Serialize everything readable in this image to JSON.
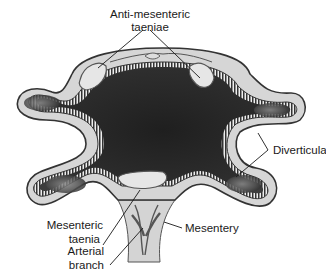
{
  "figure": {
    "colors": {
      "lumen_dark": "#2b2b2b",
      "lumen_mid": "#6a6a6a",
      "wall_outline": "#3a3a3a",
      "serosa_fill": "#d9d9d9",
      "background": "#ffffff",
      "text": "#1a1a1a"
    }
  },
  "labels": {
    "anti_mesenteric_line1": "Anti-mesenteric",
    "anti_mesenteric_line2": "taeniae",
    "diverticula": "Diverticula",
    "mesenteric_line1": "Mesenteric",
    "mesenteric_line2": "taenia",
    "mesentery": "Mesentery",
    "arterial_line1": "Arterial",
    "arterial_line2": "branch"
  }
}
